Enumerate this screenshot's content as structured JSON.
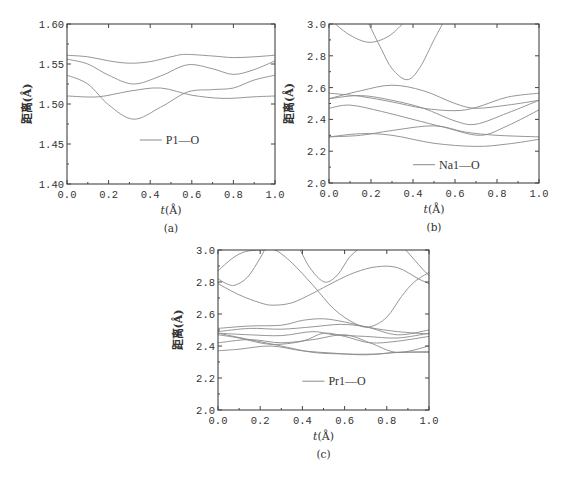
{
  "chart_data": [
    {
      "id": "a",
      "type": "line",
      "caption": "(a)",
      "xlabel": "t(Å)",
      "ylabel": "距离(Å)",
      "xlim": [
        0.0,
        1.0
      ],
      "ylim": [
        1.4,
        1.6
      ],
      "xticks": [
        "0.0",
        "0.2",
        "0.4",
        "0.6",
        "0.8",
        "1.0"
      ],
      "yticks": [
        "1.40",
        "1.45",
        "1.50",
        "1.55",
        "1.60"
      ],
      "ytick_values": [
        1.4,
        1.45,
        1.5,
        1.55,
        1.6
      ],
      "legend": {
        "label": "P1—O",
        "x": 0.35,
        "y": 1.455
      },
      "grid": false,
      "frame": {
        "left": 67,
        "top": 24,
        "right": 275,
        "bottom": 184
      },
      "series": [
        {
          "name": "P1—O #1",
          "x": [
            0,
            0.1,
            0.2,
            0.3,
            0.4,
            0.5,
            0.57,
            0.7,
            0.8,
            0.9,
            1.0
          ],
          "y": [
            1.561,
            1.559,
            1.554,
            1.551,
            1.553,
            1.559,
            1.562,
            1.56,
            1.558,
            1.559,
            1.561
          ]
        },
        {
          "name": "P1—O #2",
          "x": [
            0,
            0.1,
            0.2,
            0.32,
            0.45,
            0.58,
            0.7,
            0.8,
            0.9,
            1.0
          ],
          "y": [
            1.556,
            1.55,
            1.536,
            1.525,
            1.535,
            1.549,
            1.544,
            1.537,
            1.543,
            1.554
          ]
        },
        {
          "name": "P1—O #3",
          "x": [
            0,
            0.1,
            0.2,
            0.32,
            0.45,
            0.58,
            0.7,
            0.8,
            0.9,
            1.0
          ],
          "y": [
            1.536,
            1.525,
            1.499,
            1.481,
            1.496,
            1.515,
            1.518,
            1.52,
            1.53,
            1.536
          ]
        },
        {
          "name": "P1—O #4",
          "x": [
            0,
            0.15,
            0.3,
            0.45,
            0.6,
            0.75,
            0.9,
            1.0
          ],
          "y": [
            1.51,
            1.509,
            1.516,
            1.52,
            1.511,
            1.507,
            1.509,
            1.51
          ]
        }
      ]
    },
    {
      "id": "b",
      "type": "line",
      "caption": "(b)",
      "xlabel": "t(Å)",
      "ylabel": "距离(Å)",
      "xlim": [
        0.0,
        1.0
      ],
      "ylim": [
        2.0,
        3.0
      ],
      "xticks": [
        "0.0",
        "0.2",
        "0.4",
        "0.6",
        "0.8",
        "1.0"
      ],
      "yticks": [
        "2.0",
        "2.2",
        "2.4",
        "2.6",
        "2.8",
        "3.0"
      ],
      "ytick_values": [
        2.0,
        2.2,
        2.4,
        2.6,
        2.8,
        3.0
      ],
      "legend": {
        "label": "Na1—O",
        "x": 0.4,
        "y": 2.115
      },
      "grid": false,
      "frame": {
        "left": 329,
        "top": 24,
        "right": 539,
        "bottom": 183
      },
      "series": [
        {
          "name": "Na1—O #1",
          "x": [
            0.03,
            0.1,
            0.19,
            0.28,
            0.35
          ],
          "y": [
            3.0,
            2.93,
            2.885,
            2.92,
            3.0
          ]
        },
        {
          "name": "Na1—O #2",
          "x": [
            0.19,
            0.25,
            0.3,
            0.37,
            0.43,
            0.5,
            0.54
          ],
          "y": [
            3.0,
            2.84,
            2.72,
            2.65,
            2.72,
            2.9,
            3.0
          ]
        },
        {
          "name": "Na1—O #3",
          "x": [
            0,
            0.15,
            0.3,
            0.45,
            0.6,
            0.7,
            0.85,
            1.0
          ],
          "y": [
            2.53,
            2.58,
            2.615,
            2.58,
            2.5,
            2.47,
            2.49,
            2.52
          ]
        },
        {
          "name": "Na1—O #4",
          "x": [
            0,
            0.15,
            0.3,
            0.45,
            0.6,
            0.7,
            0.85,
            1.0
          ],
          "y": [
            2.565,
            2.545,
            2.51,
            2.47,
            2.455,
            2.475,
            2.54,
            2.565
          ]
        },
        {
          "name": "Na1—O #5",
          "x": [
            0,
            0.15,
            0.3,
            0.45,
            0.6,
            0.7,
            0.85,
            1.0
          ],
          "y": [
            2.53,
            2.55,
            2.52,
            2.47,
            2.39,
            2.37,
            2.44,
            2.52
          ]
        },
        {
          "name": "Na1—O #6",
          "x": [
            0,
            0.1,
            0.25,
            0.4,
            0.55,
            0.72,
            0.85,
            1.0
          ],
          "y": [
            2.47,
            2.49,
            2.45,
            2.4,
            2.35,
            2.3,
            2.36,
            2.46
          ]
        },
        {
          "name": "Na1—O #7",
          "x": [
            0,
            0.15,
            0.3,
            0.5,
            0.65,
            0.8,
            1.0
          ],
          "y": [
            2.29,
            2.3,
            2.33,
            2.36,
            2.32,
            2.3,
            2.29
          ]
        },
        {
          "name": "Na1—O #8",
          "x": [
            0,
            0.15,
            0.3,
            0.5,
            0.7,
            0.85,
            1.0
          ],
          "y": [
            2.29,
            2.31,
            2.3,
            2.25,
            2.23,
            2.245,
            2.275
          ]
        }
      ]
    },
    {
      "id": "c",
      "type": "line",
      "caption": "(c)",
      "xlabel": "t(Å)",
      "ylabel": "距离(Å)",
      "xlim": [
        0.0,
        1.0
      ],
      "ylim": [
        2.0,
        3.0
      ],
      "xticks": [
        "0.0",
        "0.2",
        "0.4",
        "0.6",
        "0.8",
        "1.0"
      ],
      "yticks": [
        "2.0",
        "2.2",
        "2.4",
        "2.6",
        "2.8",
        "3.0"
      ],
      "ytick_values": [
        2.0,
        2.2,
        2.4,
        2.6,
        2.8,
        3.0
      ],
      "legend": {
        "label": "Pr1—O",
        "x": 0.4,
        "y": 2.18
      },
      "grid": false,
      "frame": {
        "left": 218,
        "top": 250,
        "right": 429,
        "bottom": 410
      },
      "series": [
        {
          "name": "Pr1—O #1",
          "x": [
            0,
            0.07,
            0.13,
            0.2,
            0.23
          ],
          "y": [
            2.87,
            2.95,
            2.99,
            3.0,
            3.0
          ]
        },
        {
          "name": "Pr1—O #2",
          "x": [
            0,
            0.04,
            0.08,
            0.14,
            0.2,
            0.22
          ],
          "y": [
            2.82,
            2.79,
            2.78,
            2.83,
            2.95,
            3.0
          ]
        },
        {
          "name": "Pr1—O #3",
          "x": [
            0,
            0.1,
            0.2,
            0.26,
            0.35,
            0.45,
            0.55,
            0.65,
            0.75,
            0.85,
            0.95,
            1.0
          ],
          "y": [
            2.79,
            2.72,
            2.67,
            2.655,
            2.67,
            2.73,
            2.8,
            2.86,
            2.895,
            2.89,
            2.82,
            2.79
          ]
        },
        {
          "name": "Pr1—O #4",
          "x": [
            0.21,
            0.27,
            0.35,
            0.45,
            0.55,
            0.65,
            0.72,
            0.8,
            0.87,
            0.93,
            1.0
          ],
          "y": [
            3.0,
            3.0,
            2.92,
            2.78,
            2.63,
            2.54,
            2.52,
            2.58,
            2.71,
            2.8,
            2.86
          ]
        },
        {
          "name": "Pr1—O #5",
          "x": [
            0.39,
            0.43,
            0.48,
            0.52,
            0.57,
            0.62,
            0.66
          ],
          "y": [
            3.0,
            2.9,
            2.82,
            2.8,
            2.85,
            2.95,
            3.0
          ]
        },
        {
          "name": "Pr1—O #6",
          "x": [
            0.89,
            0.93,
            0.97,
            1.0
          ],
          "y": [
            3.0,
            2.94,
            2.88,
            2.84
          ]
        },
        {
          "name": "Pr1—O #7",
          "x": [
            0,
            0.15,
            0.3,
            0.4,
            0.5,
            0.6,
            0.72,
            0.85,
            1.0
          ],
          "y": [
            2.51,
            2.525,
            2.53,
            2.56,
            2.57,
            2.55,
            2.515,
            2.49,
            2.475
          ]
        },
        {
          "name": "Pr1—O #8",
          "x": [
            0,
            0.15,
            0.3,
            0.45,
            0.58,
            0.7,
            0.85,
            1.0
          ],
          "y": [
            2.49,
            2.51,
            2.505,
            2.52,
            2.535,
            2.52,
            2.47,
            2.5
          ]
        },
        {
          "name": "Pr1—O #9",
          "x": [
            0,
            0.15,
            0.3,
            0.45,
            0.55,
            0.7,
            0.85,
            1.0
          ],
          "y": [
            2.48,
            2.47,
            2.465,
            2.49,
            2.47,
            2.46,
            2.45,
            2.48
          ]
        },
        {
          "name": "Pr1—O #10",
          "x": [
            0,
            0.1,
            0.25,
            0.4,
            0.5,
            0.6,
            0.72,
            0.85,
            1.0
          ],
          "y": [
            2.47,
            2.45,
            2.41,
            2.43,
            2.48,
            2.46,
            2.42,
            2.43,
            2.46
          ]
        },
        {
          "name": "Pr1—O #11",
          "x": [
            0,
            0.15,
            0.3,
            0.45,
            0.6,
            0.72,
            0.85,
            1.0
          ],
          "y": [
            2.42,
            2.44,
            2.42,
            2.44,
            2.47,
            2.42,
            2.36,
            2.4
          ]
        },
        {
          "name": "Pr1—O #12",
          "x": [
            0,
            0.1,
            0.25,
            0.4,
            0.55,
            0.7,
            0.85,
            1.0
          ],
          "y": [
            2.37,
            2.38,
            2.4,
            2.37,
            2.355,
            2.345,
            2.36,
            2.36
          ]
        },
        {
          "name": "Pr1—O #13",
          "x": [
            0,
            0.15,
            0.3,
            0.45,
            0.6,
            0.75,
            0.85,
            1.0
          ],
          "y": [
            2.48,
            2.44,
            2.4,
            2.36,
            2.35,
            2.35,
            2.36,
            2.365
          ]
        }
      ]
    }
  ],
  "style": {
    "line_color": "#8a8a8a",
    "axis_color": "#444444",
    "text_color": "#333333",
    "background": "#ffffff"
  }
}
